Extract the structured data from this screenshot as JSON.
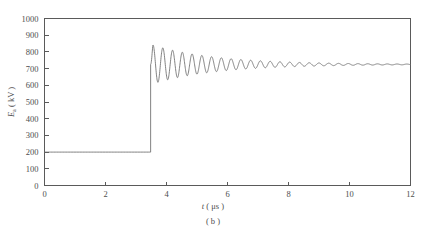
{
  "figure": {
    "caption": "( b )",
    "background": "#ffffff",
    "line_color": "#6b6b6b",
    "axis_color": "#5a5a5a"
  },
  "chart_data": {
    "type": "line",
    "title": "",
    "subtitle": "",
    "caption": "( b )",
    "xlabel_italic": "t",
    "xlabel_unit": "( μs )",
    "ylabel_italic": "E",
    "ylabel_sub": "a",
    "ylabel_unit": "( kV )",
    "xlabel": "t ( μs )",
    "ylabel": "E a ( kV )",
    "xlim": [
      0,
      12
    ],
    "ylim": [
      0,
      1000
    ],
    "xticks": [
      0,
      2,
      4,
      6,
      8,
      10,
      12
    ],
    "xtick_labels": [
      "0",
      "2",
      "4",
      "6",
      "8",
      "10",
      "12"
    ],
    "xticks_minor": [
      1,
      3,
      5,
      7,
      9,
      11
    ],
    "yticks": [
      0,
      100,
      200,
      300,
      400,
      500,
      600,
      700,
      800,
      900,
      1000
    ],
    "ytick_labels": [
      "0",
      "100",
      "200",
      "300",
      "400",
      "500",
      "600",
      "700",
      "800",
      "900",
      "1000"
    ],
    "grid": false,
    "legend": null,
    "legend_position": "none",
    "ticks_direction": "in",
    "series": [
      {
        "name": "E_a",
        "description": "Step response: flat pre-fault level then damped oscillation settling to steady state",
        "prefault_value": 200,
        "step_time": 3.48,
        "first_peak_value": 845,
        "first_peak_time": 3.62,
        "first_trough_value": 445,
        "steady_state_value": 725,
        "oscillation_period": 0.32,
        "damping_time_constant": 2.1,
        "x": [
          0,
          0.5,
          1,
          1.5,
          2,
          2.5,
          3,
          3.4,
          3.48,
          3.62,
          3.78,
          3.94,
          4.1,
          4.26,
          4.42,
          4.58,
          4.74,
          4.9,
          5.06,
          5.22,
          5.38,
          5.54,
          5.7,
          5.86,
          6.02,
          6.18,
          6.34,
          6.5,
          6.66,
          6.82,
          6.98,
          7.14,
          7.3,
          7.46,
          7.62,
          7.78,
          7.94,
          8.1,
          8.26,
          8.42,
          8.58,
          8.74,
          8.9,
          9.06,
          9.22,
          9.38,
          9.54,
          9.7,
          9.86,
          10.02,
          10.18,
          10.34,
          10.5,
          10.66,
          10.82,
          10.98,
          11.14,
          11.3,
          11.46,
          11.62,
          11.78,
          11.94,
          12
        ],
        "y": [
          200,
          200,
          200,
          200,
          200,
          200,
          200,
          200,
          200,
          845,
          445,
          830,
          487,
          812,
          525,
          795,
          558,
          782,
          588,
          772,
          612,
          768,
          635,
          762,
          652,
          758,
          668,
          756,
          680,
          754,
          690,
          752,
          698,
          751,
          704,
          750,
          709,
          749,
          713,
          748,
          716,
          747,
          718,
          745,
          720,
          744,
          721,
          743,
          722,
          742,
          722,
          741,
          723,
          740,
          723,
          739,
          724,
          738,
          724,
          737,
          724,
          736,
          725
        ]
      }
    ]
  },
  "axes": {
    "y_label_parts": {
      "symbol": "E",
      "subscript": "a",
      "unit": "( kV )"
    },
    "x_label_parts": {
      "symbol": "t",
      "unit": "( μs )"
    }
  }
}
